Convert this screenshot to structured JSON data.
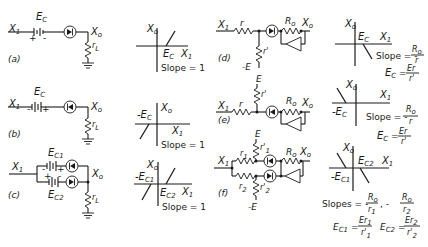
{
  "figure": {
    "panels": [
      {
        "id": "a",
        "caption": "(a)",
        "input": "X",
        "input_sub": "1",
        "output": "X",
        "output_sub": "o",
        "battery_label": "E",
        "battery_sub": "C",
        "battery_polarity_left": "+",
        "battery_polarity_right": "-",
        "load": "r",
        "load_sub": "L"
      },
      {
        "id": "b",
        "caption": "(b)",
        "input": "X",
        "input_sub": "1",
        "output": "X",
        "output_sub": "o",
        "battery_label": "E",
        "battery_sub": "C",
        "battery_polarity_left": "-",
        "battery_polarity_right": "+",
        "load": "r",
        "load_sub": "L"
      },
      {
        "id": "c",
        "caption": "(c)",
        "input": "X",
        "input_sub": "1",
        "output": "X",
        "output_sub": "o",
        "battery1_label": "E",
        "battery1_sub": "C1",
        "battery2_label": "E",
        "battery2_sub": "C2",
        "b1_left": "-",
        "b1_right": "+",
        "b2_left": "+",
        "b2_right": "-",
        "load": "r",
        "load_sub": "L"
      },
      {
        "id": "d",
        "caption": "(d)",
        "input": "X",
        "input_sub": "1",
        "output": "X",
        "output_sub": "o",
        "r": "r",
        "r_prime": "r'",
        "supply": "-E",
        "feedback": "R",
        "feedback_sub": "o"
      },
      {
        "id": "e",
        "caption": "(e)",
        "input": "X",
        "input_sub": "1",
        "output": "X",
        "output_sub": "o",
        "r": "r",
        "r_prime": "r'",
        "supply": "E",
        "feedback": "R",
        "feedback_sub": "o"
      },
      {
        "id": "f",
        "caption": "(f)",
        "input": "X",
        "input_sub": "1",
        "output": "X",
        "output_sub": "o",
        "r1": "r",
        "r1_sub": "1",
        "r2": "r",
        "r2_sub": "2",
        "r1_prime": "r'",
        "r1_prime_sub": "1",
        "r2_prime": "r'",
        "r2_prime_sub": "2",
        "supply_top": "E",
        "supply_bottom": "-E",
        "feedback": "R",
        "feedback_sub": "o"
      }
    ],
    "graphs": [
      {
        "id": "a",
        "y_axis": "X",
        "y_sub": "o",
        "x_axis": "X",
        "x_sub": "1",
        "break_label": "E",
        "break_sub": "C",
        "slope_text": "Slope = 1"
      },
      {
        "id": "b",
        "y_axis": "X",
        "y_sub": "o",
        "x_axis": "X",
        "x_sub": "1",
        "break_label": "-E",
        "break_sub": "C",
        "slope_text": "Slope = 1"
      },
      {
        "id": "c",
        "y_axis": "X",
        "y_sub": "o",
        "x_axis": "X",
        "x_sub": "1",
        "break1_label": "-E",
        "break1_sub": "C1",
        "break2_label": "E",
        "break2_sub": "C2",
        "slope_text": "Slope = 1"
      },
      {
        "id": "d",
        "y_axis": "X",
        "y_sub": "o",
        "x_axis": "X",
        "x_sub": "1",
        "break_label": "E",
        "break_sub": "C",
        "slope_prefix": "Slope = -",
        "slope_num": "R",
        "slope_num_sub": "o",
        "slope_den": "r",
        "ec_label": "E",
        "ec_sub": "C",
        "ec_num": "Er",
        "ec_den": "r'"
      },
      {
        "id": "e",
        "y_axis": "X",
        "y_sub": "o",
        "x_axis": "X",
        "x_sub": "1",
        "break_label": "-E",
        "break_sub": "C",
        "slope_prefix": "Slope = -",
        "slope_num": "R",
        "slope_num_sub": "o",
        "slope_den": "r",
        "ec_label": "E",
        "ec_sub": "C",
        "ec_num": "Er",
        "ec_den": "r'"
      },
      {
        "id": "f",
        "y_axis": "X",
        "y_sub": "o",
        "x_axis": "X",
        "x_sub": "1",
        "break1_label": "-E",
        "break1_sub": "C1",
        "break2_label": "E",
        "break2_sub": "C2",
        "slopes_prefix": "Slopes = -",
        "s1_num": "R",
        "s1_num_sub": "o",
        "s1_den": "r",
        "s1_den_sub": "1",
        "s2_prefix": ", -",
        "s2_num": "R",
        "s2_num_sub": "o",
        "s2_den": "r",
        "s2_den_sub": "2",
        "ec1_label": "E",
        "ec1_sub": "C1",
        "ec1_num": "Er",
        "ec1_num_sub": "1",
        "ec1_den": "r'",
        "ec1_den_sub": "1",
        "ec2_label": "E",
        "ec2_sub": "C2",
        "ec2_num": "Er",
        "ec2_num_sub": "2",
        "ec2_den": "r'",
        "ec2_den_sub": "2"
      }
    ],
    "symbols": {
      "eq": "="
    }
  }
}
